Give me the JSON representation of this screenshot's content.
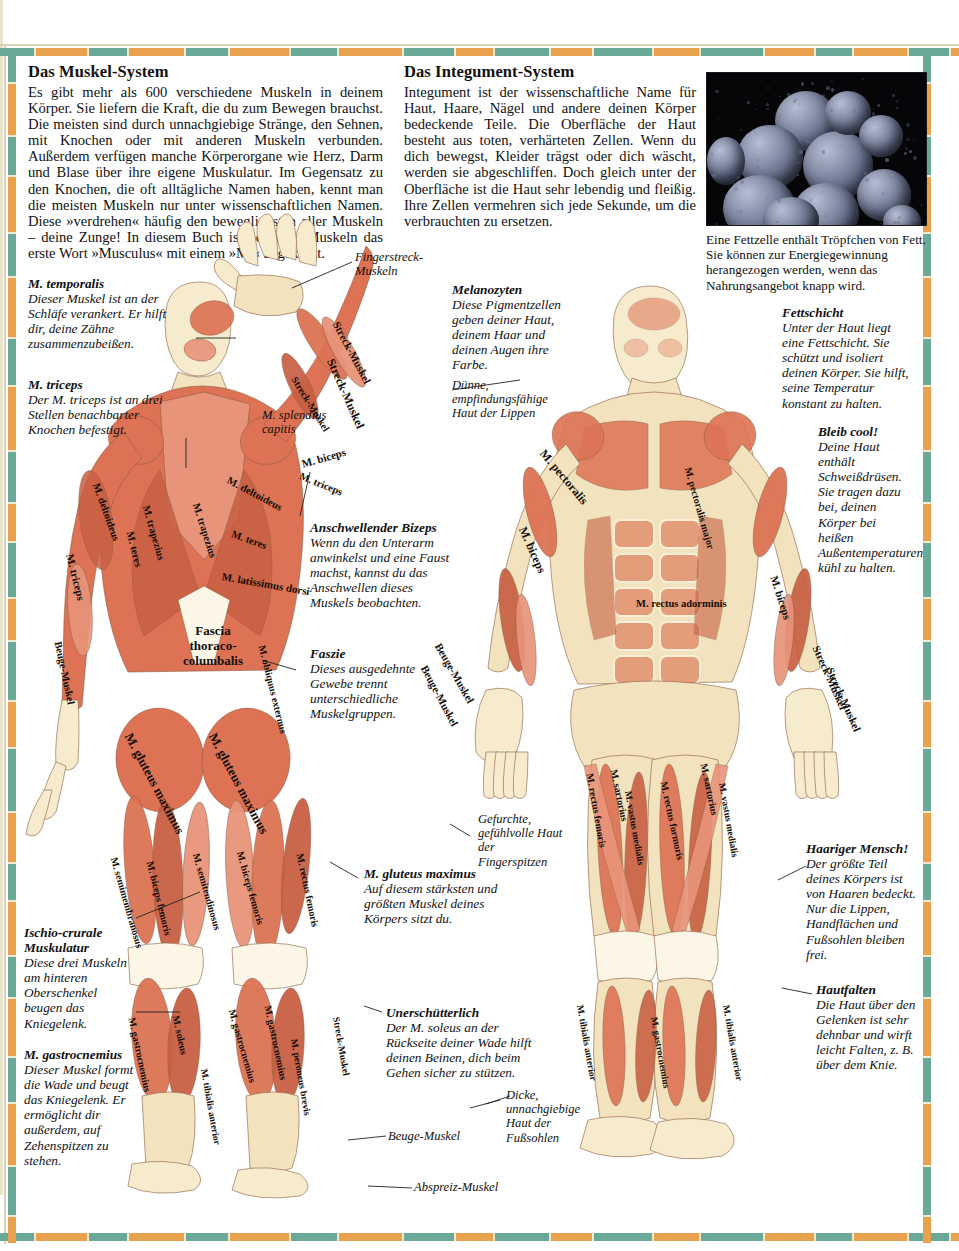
{
  "page": {
    "border_colors": {
      "teal": "#6aa898",
      "orange": "#e8a24e",
      "cream": "#efe8d2",
      "hairline": "#d9d2ba"
    }
  },
  "intro_left": {
    "heading": "Das Muskel-System",
    "body": "Es gibt mehr als 600 verschiedene Muskeln in deinem Körper. Sie liefern die Kraft, die du zum Bewegen brauchst. Die meisten sind durch unnachgiebige Stränge, den Sehnen, mit Knochen oder mit anderen Muskeln verbunden. Außerdem verfügen manche Körperorgane wie Herz, Darm und Blase über ihre eigene Muskulatur. Im Gegensatz zu den Knochen, die oft alltägliche Namen haben, kennt man die meisten Muskeln nur unter wissenschaftlichen Namen. Diese »verdrehen« häufig den beweglichsten aller Muskeln – deine Zunge! In diesem Buch ist bei allen Muskeln das erste Wort »Musculus« mit einem »M.« abgekürzt."
  },
  "intro_right": {
    "heading": "Das Integument-System",
    "body": "Integument ist der wissenschaftliche Name für Haut, Haare, Nägel und andere deinen Körper bedeckende Teile. Die Oberfläche der Haut besteht aus toten, verhärteten Zellen. Wenn du dich bewegst, Kleider trägst oder dich wäscht, werden sie abgeschliffen. Doch gleich unter der Oberfläche ist die Haut sehr lebendig und fleißig. Ihre Zellen vermehren sich jede Sekunde, um die verbrauchten zu ersetzen."
  },
  "photo": {
    "name": "fat-cell-micrograph",
    "caption": "Eine Fettzelle enthält Tröpfchen von Fett. Sie können zur Energiegewinnung herangezogen werden, wenn das Nahrungsangebot knapp wird."
  },
  "callouts": [
    {
      "id": "temporalis",
      "heading": "M. temporalis",
      "body": "Dieser Muskel ist an der Schläfe verankert. Er hilft dir, deine Zähne zusammenzubeißen."
    },
    {
      "id": "triceps",
      "heading": "M. triceps",
      "body": "Der M. triceps ist an drei Stellen benachbarter Knochen befestigt."
    },
    {
      "id": "bizeps",
      "heading": "Anschwellender Bizeps",
      "body": "Wenn du den Unterarm anwinkelst und eine Faust machst, kannst du das Anschwellen dieses Muskels beobachten."
    },
    {
      "id": "faszie",
      "heading": "Faszie",
      "body": "Dieses ausgedehnte Gewebe trennt unterschiedliche Muskelgruppen."
    },
    {
      "id": "ischio",
      "heading": "Ischio-crurale Muskulatur",
      "body": "Diese drei Muskeln am hinteren Oberschenkel beugen das Kniegelenk."
    },
    {
      "id": "gastro",
      "heading": "M. gastrocnemius",
      "body": "Dieser Muskel formt die Wade und beugt das Kniegelenk. Er ermöglicht dir außerdem, auf Zehenspitzen zu stehen."
    },
    {
      "id": "gluteus",
      "heading": "M. gluteus maximus",
      "body": "Auf diesem stärksten und größten Muskel deines Körpers sitzt du."
    },
    {
      "id": "soleus",
      "heading": "Unerschütterlich",
      "body": "Der M. soleus an der Rückseite deiner Wade hilft deinen Beinen, dich beim Gehen sicher zu stützen."
    },
    {
      "id": "melano",
      "heading": "Melanozyten",
      "body": "Diese Pigmentzellen geben deiner Haut, deinem Haar und deinen Augen ihre Farbe."
    },
    {
      "id": "fettschicht",
      "heading": "Fettschicht",
      "body": "Unter der Haut liegt eine Fettschicht. Sie schützt und isoliert deinen Körper. Sie hilft, seine Temperatur konstant zu halten."
    },
    {
      "id": "bleibcool",
      "heading": "Bleib cool!",
      "body": "Deine Haut enthält Schweißdrüsen. Sie tragen dazu bei, deinen Körper bei heißen Außentemperaturen kühl zu halten."
    },
    {
      "id": "haarig",
      "heading": "Haariger Mensch!",
      "body": "Der größte Teil deines Körpers ist von Haaren bedeckt. Nur die Lippen, Handflächen und Fußsohlen bleiben frei."
    },
    {
      "id": "hautfalten",
      "heading": "Hautfalten",
      "body": "Die Haut über den Gelenken ist sehr dehnbar und wirft leicht Falten, z. B. über dem Knie."
    }
  ],
  "plain_labels": [
    {
      "id": "fingerstreck",
      "text": "Fingerstreck-Muskeln"
    },
    {
      "id": "splendius",
      "text": "M. splendius capitis"
    },
    {
      "id": "lippenhaut",
      "text": "Dünne, empfindungsfähige Haut der Lippen"
    },
    {
      "id": "fingerspitzen",
      "text": "Gefurchte, gefühlvolle Haut der Fingerspitzen"
    },
    {
      "id": "fusssohlen",
      "text": "Dicke, unnachgiebige Haut der Fußsohlen"
    },
    {
      "id": "beugemuskel",
      "text": "Beuge-Muskel"
    },
    {
      "id": "abspreiz",
      "text": "Abspreiz-Muskel"
    }
  ],
  "fascia_label": "Fascia thoraco-columbalis",
  "muscle_labels_back": [
    "Streck-Muskel",
    "Streck-Muskel",
    "Streck-Muskel",
    "M. deltoideus",
    "M. deltoideus",
    "M. trapezius",
    "M. trapezius",
    "M. teres",
    "M. teres",
    "M. triceps",
    "M. triceps",
    "M. biceps",
    "M. latissimus dorsi",
    "M. obliquus externus",
    "Beuge-Muskel",
    "M. gluteus maximus",
    "M. gluteus maximus",
    "M. semimembranosus",
    "M. semitendinosus",
    "M. biceps femoris",
    "M. biceps femoris",
    "M. rectus femoris",
    "M. gastrocnemius",
    "M. gastrocnemius",
    "M. gastrocnemius",
    "M. soleus",
    "M. peroneus brevis",
    "M. tibialis anterior",
    "Streck-Muskel"
  ],
  "muscle_labels_front": [
    "M. pectoralis",
    "M. pectoralis major",
    "M. biceps",
    "M. biceps",
    "M. rectus adorminis",
    "Beuge-Muskel",
    "Beuge-Muskel",
    "Streck-Muskel",
    "Streck-Muskel",
    "M. sartorius",
    "M. sartorius",
    "M. rectus femoris",
    "M. rectus formoris",
    "M. vastus medialis",
    "M. vastus medialis",
    "M. tibialis anterior",
    "M. tibialis anterior",
    "M. gastrocnemius"
  ]
}
